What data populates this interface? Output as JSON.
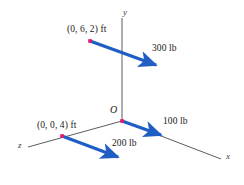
{
  "figure": {
    "background_color": "#ffffff",
    "axis_color": "#4a4a4a",
    "force_color": "#1f5fc4",
    "point_color": "#e8166b"
  },
  "axes": [
    {
      "name": "y",
      "label": "y",
      "label_x": 123,
      "label_y": 8,
      "x1": 122,
      "y1": 18,
      "x2": 122,
      "y2": 121
    },
    {
      "name": "x",
      "label": "x",
      "label_x": 226,
      "label_y": 152,
      "x1": 122,
      "y1": 121,
      "x2": 221,
      "y2": 159
    },
    {
      "name": "z",
      "label": "z",
      "label_x": 18,
      "label_y": 141,
      "x1": 122,
      "y1": 121,
      "x2": 28,
      "y2": 147
    }
  ],
  "origin": {
    "label": "O",
    "label_x": 110,
    "label_y": 105,
    "x": 122,
    "y": 121
  },
  "points": [
    {
      "name": "point-0-6-2",
      "label": "(0, 6, 2) ft",
      "label_x": 67,
      "label_y": 25,
      "x": 90,
      "y": 41
    },
    {
      "name": "point-0-0-4",
      "label": "(0, 0, 4) ft",
      "label_x": 37,
      "label_y": 121,
      "x": 62,
      "y": 136
    }
  ],
  "forces": [
    {
      "name": "force-300-lb",
      "label": "300 lb",
      "label_x": 152,
      "label_y": 44,
      "x1": 90,
      "y1": 41,
      "x2": 156,
      "y2": 65
    },
    {
      "name": "force-100-lb",
      "label": "100 lb",
      "label_x": 163,
      "label_y": 117,
      "x1": 122,
      "y1": 121,
      "x2": 161,
      "y2": 135
    },
    {
      "name": "force-200-lb",
      "label": "200 lb",
      "label_x": 112,
      "label_y": 139,
      "x1": 62,
      "y1": 136,
      "x2": 118,
      "y2": 157
    }
  ]
}
